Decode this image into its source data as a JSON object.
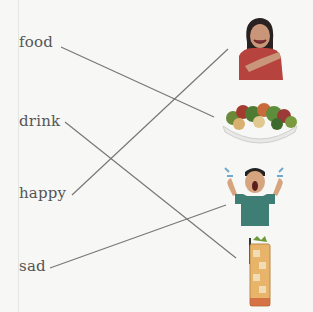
{
  "exercise": {
    "words": [
      {
        "id": "food",
        "label": "food"
      },
      {
        "id": "drink",
        "label": "drink"
      },
      {
        "id": "happy",
        "label": "happy"
      },
      {
        "id": "sad",
        "label": "sad"
      }
    ],
    "pictures": [
      {
        "id": "happy-woman",
        "description": "smiling woman"
      },
      {
        "id": "salad-bowl",
        "description": "bowl of salad"
      },
      {
        "id": "crying-man",
        "description": "crying man"
      },
      {
        "id": "iced-drink",
        "description": "glass of iced drink"
      }
    ],
    "matches": [
      {
        "word": "food",
        "picture": "salad-bowl"
      },
      {
        "word": "drink",
        "picture": "iced-drink"
      },
      {
        "word": "happy",
        "picture": "happy-woman"
      },
      {
        "word": "sad",
        "picture": "crying-man"
      }
    ]
  },
  "colors": {
    "background": "#f7f7f5",
    "text": "#555555",
    "line": "#777777"
  }
}
